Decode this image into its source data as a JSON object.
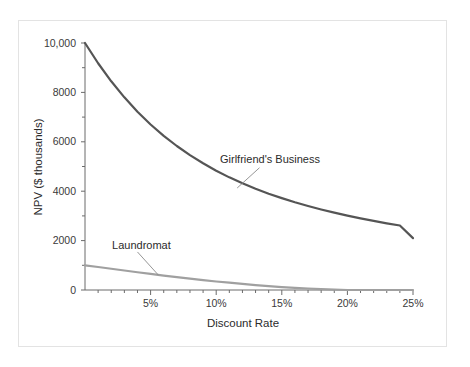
{
  "chart_data": {
    "type": "line",
    "title": "",
    "subtitle": "",
    "xlabel": "Discount Rate",
    "ylabel": "NPV ($ thousands)",
    "xlim": [
      0,
      25
    ],
    "ylim": [
      0,
      10000
    ],
    "grid": false,
    "legend_position": "inline-annotations",
    "x_tick_labels": [
      "5%",
      "10%",
      "15%",
      "20%",
      "25%"
    ],
    "x_tick_values": [
      5,
      10,
      15,
      20,
      25
    ],
    "x_minor_tick_values": [
      1,
      2,
      3,
      4,
      6,
      7,
      8,
      9,
      11,
      12,
      13,
      14,
      16,
      17,
      18,
      19,
      21,
      22,
      23,
      24
    ],
    "y_tick_labels": [
      "0",
      "2000",
      "4000",
      "6000",
      "8000",
      "10,000"
    ],
    "y_tick_values": [
      0,
      2000,
      4000,
      6000,
      8000,
      10000
    ],
    "y_minor_tick_values": [
      1000,
      3000,
      5000,
      7000,
      9000
    ],
    "series": [
      {
        "name": "Girlfriend's Business",
        "color": "#555555",
        "width": 2.2,
        "x": [
          0,
          1,
          2,
          3,
          4,
          5,
          6,
          7,
          8,
          9,
          10,
          11,
          12,
          13,
          14,
          15,
          16,
          17,
          18,
          19,
          20,
          21,
          22,
          23,
          24,
          25
        ],
        "values": [
          10000,
          9180,
          8450,
          7800,
          7220,
          6700,
          6240,
          5830,
          5460,
          5130,
          4830,
          4560,
          4320,
          4100,
          3900,
          3720,
          3550,
          3400,
          3260,
          3130,
          3010,
          2900,
          2800,
          2700,
          2610,
          2100
        ],
        "label_text": "Girlfriend's Business",
        "label_x": 14.1,
        "label_y": 5300,
        "leader_from_x": 13.3,
        "leader_from_y": 4950,
        "leader_to_x": 11.6,
        "leader_to_y": 4130
      },
      {
        "name": "Laundromat",
        "color": "#a0a0a0",
        "width": 2.2,
        "x": [
          0,
          1,
          2,
          3,
          4,
          5,
          6,
          7,
          8,
          9,
          10,
          11,
          12,
          13,
          14,
          15,
          16,
          17,
          18,
          19,
          20,
          21,
          22,
          23,
          24,
          25
        ],
        "values": [
          1000,
          930,
          860,
          790,
          720,
          650,
          585,
          520,
          460,
          400,
          345,
          295,
          245,
          200,
          160,
          120,
          90,
          60,
          35,
          15,
          0,
          -15,
          -30,
          -45,
          -60,
          -75
        ],
        "label_text": "Laundromat",
        "label_x": 4.3,
        "label_y": 1830,
        "leader_from_x": 4.0,
        "leader_from_y": 1540,
        "leader_to_x": 5.6,
        "leader_to_y": 600
      }
    ]
  },
  "axes": {
    "x_axis_title": "Discount Rate",
    "y_axis_title": "NPV ($ thousands)",
    "axis_color": "#6b6b6b"
  },
  "colors": {
    "background": "#ffffff",
    "frame_border": "#e3e3e3",
    "series_primary": "#555555",
    "series_secondary": "#a0a0a0",
    "text": "#2b2b2b",
    "tick_text": "#3a3a3a"
  }
}
